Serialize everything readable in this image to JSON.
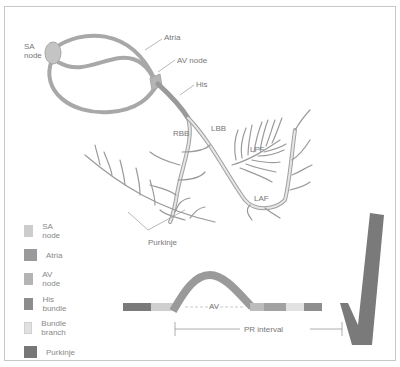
{
  "diagram": {
    "anatomy_labels": {
      "sa_node": "SA\nnode",
      "atria": "Atria",
      "av_node": "AV node",
      "his": "His",
      "rbb": "RBB",
      "lbb": "LBB",
      "lpf": "LPF",
      "laf": "LAF",
      "purkinje": "Purkinje"
    },
    "waveform_labels": {
      "av": "AV",
      "pr_interval": "PR interval"
    },
    "legend": [
      {
        "label": "SA node",
        "color": "#cccccc"
      },
      {
        "label": "Atria",
        "color": "#9a9a9a"
      },
      {
        "label": "AV node",
        "color": "#b4b4b4"
      },
      {
        "label": "His bundle",
        "color": "#8c8c8c"
      },
      {
        "label": "Bundle branch",
        "color": "#e2e2e2"
      },
      {
        "label": "Purkinje",
        "color": "#777777"
      }
    ],
    "colors": {
      "conduction_path": "#a8a8a8",
      "branch_light": "#dcdcdc",
      "purkinje_fibers": "#9a9a9a",
      "label_text": "#777777",
      "frame_border": "#c8c8c8",
      "qrs": "#7a7a7a"
    }
  }
}
